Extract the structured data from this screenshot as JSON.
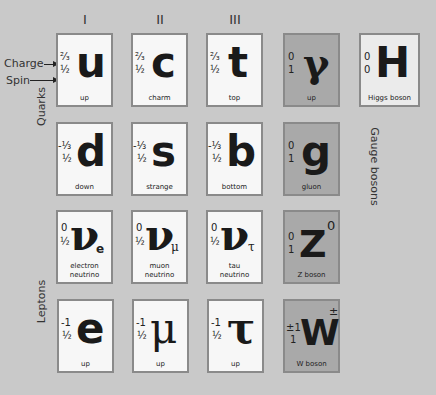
{
  "generations": [
    "I",
    "II",
    "III"
  ],
  "annotations": {
    "charge_label": "Charge",
    "spin_label": "Spin"
  },
  "groups": {
    "quarks": "Quarks",
    "leptons": "Leptons",
    "gauge_bosons": "Gauge bosons"
  },
  "particles": {
    "up": {
      "symbol": "u",
      "charge": "²⁄₃",
      "spin": "½",
      "name": "up"
    },
    "charm": {
      "symbol": "c",
      "charge": "²⁄₃",
      "spin": "½",
      "name": "charm"
    },
    "top": {
      "symbol": "t",
      "charge": "²⁄₃",
      "spin": "½",
      "name": "top"
    },
    "photon": {
      "symbol": "γ",
      "charge": "0",
      "spin": "1",
      "name": "up"
    },
    "higgs": {
      "symbol": "H",
      "charge": "0",
      "spin": "0",
      "name": "Higgs boson"
    },
    "down": {
      "symbol": "d",
      "charge": "-⅓",
      "spin": "½",
      "name": "down"
    },
    "strange": {
      "symbol": "s",
      "charge": "-⅓",
      "spin": "½",
      "name": "strange"
    },
    "bottom": {
      "symbol": "b",
      "charge": "-⅓",
      "spin": "½",
      "name": "bottom"
    },
    "gluon": {
      "symbol": "g",
      "charge": "0",
      "spin": "1",
      "name": "gluon"
    },
    "nu_e": {
      "symbol": "ν",
      "sub": "e",
      "charge": "0",
      "spin": "½",
      "name_line1": "electron",
      "name_line2": "neutrino"
    },
    "nu_mu": {
      "symbol": "ν",
      "sub": "μ",
      "charge": "0",
      "spin": "½",
      "name_line1": "muon",
      "name_line2": "neutrino"
    },
    "nu_tau": {
      "symbol": "ν",
      "sub": "τ",
      "charge": "0",
      "spin": "½",
      "name_line1": "tau",
      "name_line2": "neutrino"
    },
    "z_boson": {
      "symbol": "Z",
      "sup": "0",
      "charge": "0",
      "spin": "1",
      "name": "Z boson"
    },
    "electron": {
      "symbol": "e",
      "charge": "-1",
      "spin": "½",
      "name": "up"
    },
    "muon": {
      "symbol": "μ",
      "charge": "-1",
      "spin": "½",
      "name": "up"
    },
    "tau": {
      "symbol": "τ",
      "charge": "-1",
      "spin": "½",
      "name": "up"
    },
    "w_boson": {
      "symbol": "W",
      "sup": "±",
      "charge": "±1",
      "spin": "1",
      "name": "W boson"
    }
  },
  "colors": {
    "background": "#c9c9c9",
    "fermion_card": "#f7f7f7",
    "gauge_card": "#a9a9a9",
    "higgs_card": "#ebebeb",
    "border": "#8a8a8a"
  }
}
